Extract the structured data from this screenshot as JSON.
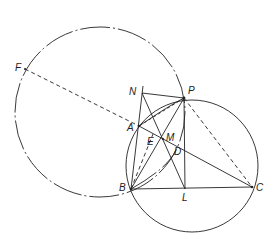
{
  "diagram": {
    "type": "geometry-construction",
    "stroke_color": "#222222",
    "background": "#ffffff",
    "points": {
      "F": {
        "label": "F",
        "x": 25,
        "y": 69
      },
      "N": {
        "label": "N",
        "x": 142,
        "y": 93
      },
      "P": {
        "label": "P",
        "x": 184,
        "y": 98
      },
      "A": {
        "label": "A",
        "x": 139,
        "y": 126
      },
      "E": {
        "label": "E",
        "x": 150,
        "y": 141
      },
      "M": {
        "label": "M",
        "x": 163,
        "y": 139
      },
      "D": {
        "label": "D",
        "x": 176,
        "y": 151
      },
      "B": {
        "label": "B",
        "x": 131,
        "y": 189
      },
      "L": {
        "label": "L",
        "x": 185,
        "y": 189
      },
      "C": {
        "label": "C",
        "x": 252,
        "y": 187
      }
    },
    "circles": [
      {
        "name": "circumcircle-ABC",
        "cx": 192,
        "cy": 166,
        "r": 66,
        "style": "solid"
      },
      {
        "name": "circle-FPB",
        "cx": 100,
        "cy": 112,
        "r": 85,
        "style": "dash-dot"
      }
    ],
    "labels": {
      "F": "F",
      "N": "N",
      "P": "P",
      "A": "A",
      "E": "E",
      "M": "M",
      "D": "D",
      "B": "B",
      "L": "L",
      "C": "C"
    }
  }
}
